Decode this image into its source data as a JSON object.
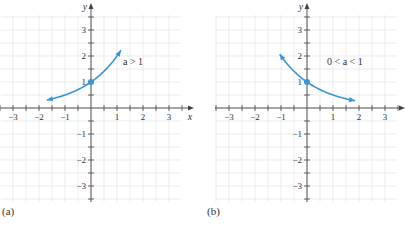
{
  "chart_data": [
    {
      "type": "line",
      "panel_label": "(a)",
      "title": "",
      "annotation": "a > 1",
      "xlabel": "x",
      "ylabel": "y",
      "xlim": [
        -3.5,
        3.5
      ],
      "ylim": [
        -3.5,
        3.5
      ],
      "x_ticks": [
        -3,
        -2,
        -1,
        1,
        2,
        3
      ],
      "y_ticks": [
        -3,
        -2,
        -1,
        1,
        2,
        3
      ],
      "grid": true,
      "grid_step": 0.5,
      "series": [
        {
          "name": "y = a^x (a > 1)",
          "function": "2^x",
          "x": [
            -1.7,
            -1.5,
            -1,
            -0.5,
            0,
            0.5,
            1,
            1.15
          ],
          "values": [
            0.31,
            0.35,
            0.5,
            0.71,
            1,
            1.41,
            2,
            3.3
          ],
          "arrows": "both"
        }
      ],
      "highlight_point": {
        "x": 0,
        "y": 1
      }
    },
    {
      "type": "line",
      "panel_label": "(b)",
      "title": "",
      "annotation": "0 < a < 1",
      "xlabel": "x",
      "ylabel": "y",
      "xlim": [
        -3.5,
        3.5
      ],
      "ylim": [
        -3.5,
        3.5
      ],
      "x_ticks": [
        -3,
        -2,
        -1,
        1,
        2,
        3
      ],
      "y_ticks": [
        -3,
        -2,
        -1,
        1,
        2,
        3
      ],
      "grid": true,
      "grid_step": 0.5,
      "series": [
        {
          "name": "y = a^x (0 < a < 1)",
          "function": "0.5^x",
          "x": [
            -1.05,
            -1,
            -0.5,
            0,
            0.5,
            1,
            1.5,
            1.85
          ],
          "values": [
            3.3,
            2,
            1.41,
            1,
            0.71,
            0.5,
            0.35,
            0.28
          ],
          "arrows": "both"
        }
      ],
      "highlight_point": {
        "x": 0,
        "y": 1
      }
    }
  ],
  "panels": {
    "a": {
      "label": "(a)",
      "annotation": "a > 1",
      "xlabel": "x",
      "ylabel": "y"
    },
    "b": {
      "label": "(b)",
      "annotation": "0 < a < 1",
      "xlabel": "x",
      "ylabel": "y"
    }
  },
  "tick_labels": {
    "x": [
      "−3",
      "−2",
      "−1",
      "1",
      "2",
      "3"
    ],
    "y": [
      "3",
      "2",
      "1",
      "−1",
      "−2",
      "−3"
    ]
  },
  "colors": {
    "curve": "#3a95d5",
    "axis": "#444444",
    "grid": "#e4e4e4",
    "text": "#333333"
  }
}
